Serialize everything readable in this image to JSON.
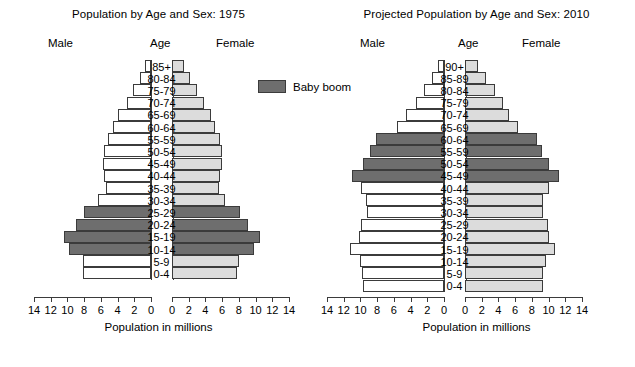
{
  "legend": {
    "label": "Baby boom",
    "swatch_color": "#6e6e6e",
    "name": "baby-boom-legend"
  },
  "colors": {
    "boom": "#6e6e6e",
    "male_normal": "#ffffff",
    "female_normal": "#dcdcdc",
    "outline": "#3b3b3b",
    "background": "#ffffff"
  },
  "panels": [
    {
      "id": "pyramid-1975",
      "title": "Population by Age and Sex: 1975",
      "head_male": "Male",
      "head_age": "Age",
      "head_female": "Female",
      "axis_title": "Population in millions",
      "male_ticklabels": [
        "14",
        "12",
        "10",
        "8",
        "6",
        "4",
        "2",
        "0"
      ],
      "female_ticklabels": [
        "0",
        "2",
        "4",
        "6",
        "8",
        "10",
        "12",
        "14"
      ]
    },
    {
      "id": "pyramid-2010",
      "title": "Projected Population by Age and Sex: 2010",
      "head_male": "Male",
      "head_age": "Age",
      "head_female": "Female",
      "axis_title": "Population in millions",
      "male_ticklabels": [
        "14",
        "12",
        "10",
        "8",
        "6",
        "4",
        "2",
        "0"
      ],
      "female_ticklabels": [
        "0",
        "2",
        "4",
        "6",
        "8",
        "10",
        "12",
        "14"
      ]
    }
  ],
  "chart_data": [
    {
      "type": "bar",
      "subtype": "population-pyramid",
      "title": "Population by Age and Sex: 1975",
      "xlabel": "Population in millions",
      "ylabel": "Age",
      "xlim": [
        0,
        14
      ],
      "xticks": [
        0,
        2,
        4,
        6,
        8,
        10,
        12,
        14
      ],
      "grid": false,
      "legend": [
        "Baby boom"
      ],
      "legend_position": "center-top-between-panels",
      "categories": [
        "85+",
        "80-84",
        "75-79",
        "70-74",
        "65-69",
        "60-64",
        "55-59",
        "50-54",
        "45-49",
        "40-44",
        "35-39",
        "30-34",
        "25-29",
        "20-24",
        "15-19",
        "10-14",
        "5-9",
        "0-4"
      ],
      "series": [
        {
          "name": "Male",
          "side": "left",
          "values": [
            0.7,
            1.3,
            2.1,
            2.9,
            3.9,
            4.6,
            5.2,
            5.6,
            5.8,
            5.6,
            5.4,
            6.3,
            8.0,
            9.0,
            10.4,
            9.8,
            8.2,
            8.1
          ]
        },
        {
          "name": "Female",
          "side": "right",
          "values": [
            1.4,
            2.1,
            3.0,
            3.8,
            4.7,
            5.2,
            5.7,
            6.0,
            6.0,
            5.8,
            5.6,
            6.4,
            8.1,
            9.1,
            10.5,
            9.8,
            8.0,
            7.8
          ]
        }
      ],
      "highlight_label": "Baby boom",
      "highlight_categories": [
        "25-29",
        "20-24",
        "15-19",
        "10-14"
      ]
    },
    {
      "type": "bar",
      "subtype": "population-pyramid",
      "title": "Projected Population by Age and Sex: 2010",
      "xlabel": "Population in millions",
      "ylabel": "Age",
      "xlim": [
        0,
        14
      ],
      "xticks": [
        0,
        2,
        4,
        6,
        8,
        10,
        12,
        14
      ],
      "grid": false,
      "legend": [
        "Baby boom"
      ],
      "legend_position": "center-top-between-panels",
      "categories": [
        "90+",
        "85-89",
        "80-84",
        "75-79",
        "70-74",
        "65-69",
        "60-64",
        "55-59",
        "50-54",
        "45-49",
        "40-44",
        "35-39",
        "30-34",
        "25-29",
        "20-24",
        "15-19",
        "10-14",
        "5-9",
        "0-4"
      ],
      "series": [
        {
          "name": "Male",
          "side": "left",
          "values": [
            0.7,
            1.4,
            2.4,
            3.4,
            4.5,
            5.6,
            8.2,
            8.9,
            9.7,
            11.0,
            9.9,
            9.3,
            9.2,
            10.0,
            10.2,
            11.3,
            10.1,
            9.8,
            9.7
          ]
        },
        {
          "name": "Female",
          "side": "right",
          "values": [
            1.6,
            2.5,
            3.6,
            4.5,
            5.3,
            6.3,
            8.6,
            9.2,
            10.1,
            11.2,
            10.0,
            9.4,
            9.3,
            9.9,
            10.0,
            10.8,
            9.7,
            9.4,
            9.3
          ]
        }
      ],
      "highlight_label": "Baby boom",
      "highlight_categories": [
        "60-64",
        "55-59",
        "50-54",
        "45-49"
      ]
    }
  ]
}
